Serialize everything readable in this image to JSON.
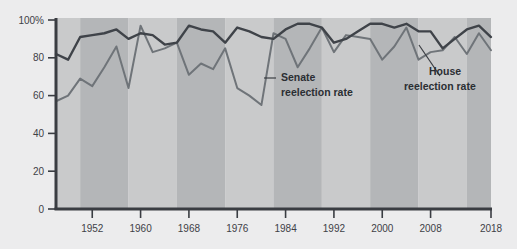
{
  "chart_data": {
    "type": "line",
    "title": "",
    "subtitle": "",
    "xlabel": "",
    "ylabel": "",
    "xlim": [
      1946,
      2018
    ],
    "ylim": [
      0,
      100
    ],
    "grid": false,
    "legend_position": "inline-annotations",
    "y_ticks": [
      0,
      20,
      40,
      60,
      80,
      100
    ],
    "y_tick_labels": [
      "0",
      "20",
      "40",
      "60",
      "80",
      "100%"
    ],
    "x_ticks": [
      1952,
      1960,
      1968,
      1976,
      1984,
      1992,
      2000,
      2008,
      2018
    ],
    "x_tick_labels": [
      "1952",
      "1960",
      "1968",
      "1976",
      "1984",
      "1992",
      "2000",
      "2008",
      "2018"
    ],
    "x": [
      1946,
      1948,
      1950,
      1952,
      1954,
      1956,
      1958,
      1960,
      1962,
      1964,
      1966,
      1968,
      1970,
      1972,
      1974,
      1976,
      1978,
      1980,
      1982,
      1984,
      1986,
      1988,
      1990,
      1992,
      1994,
      1996,
      1998,
      2000,
      2002,
      2004,
      2006,
      2008,
      2010,
      2012,
      2014,
      2016,
      2018
    ],
    "series": [
      {
        "name": "House reelection rate",
        "color": "#3f4349",
        "values": [
          82,
          79,
          91,
          92,
          93,
          95,
          90,
          93,
          92,
          87,
          88,
          97,
          95,
          94,
          88,
          96,
          94,
          91,
          90,
          95,
          98,
          98,
          96,
          88,
          90,
          94,
          98,
          98,
          96,
          98,
          94,
          94,
          85,
          90,
          95,
          97,
          91
        ]
      },
      {
        "name": "Senate reelection rate",
        "color": "#6f7479",
        "values": [
          57,
          60,
          69,
          65,
          75,
          86,
          64,
          97,
          83,
          85,
          88,
          71,
          77,
          74,
          85,
          64,
          60,
          55,
          93,
          90,
          75,
          85,
          96,
          83,
          92,
          91,
          90,
          79,
          86,
          96,
          79,
          83,
          84,
          91,
          82,
          93,
          84
        ]
      }
    ],
    "bands": [
      {
        "from": 1946,
        "to": 1950,
        "shade": "light"
      },
      {
        "from": 1950,
        "to": 1958,
        "shade": "dark"
      },
      {
        "from": 1958,
        "to": 1966,
        "shade": "light"
      },
      {
        "from": 1966,
        "to": 1974,
        "shade": "dark"
      },
      {
        "from": 1974,
        "to": 1982,
        "shade": "light"
      },
      {
        "from": 1982,
        "to": 1990,
        "shade": "dark"
      },
      {
        "from": 1990,
        "to": 1998,
        "shade": "light"
      },
      {
        "from": 1998,
        "to": 2006,
        "shade": "dark"
      },
      {
        "from": 2006,
        "to": 2014,
        "shade": "light"
      },
      {
        "from": 2014,
        "to": 2018,
        "shade": "dark"
      }
    ],
    "annotations": [
      {
        "id": "senate",
        "line1": "Senate",
        "line2": "reelection rate"
      },
      {
        "id": "house",
        "line1": "House",
        "line2": "reelection rate"
      }
    ]
  },
  "colors": {
    "page_background": "#ececed",
    "band_light": "#c9cacb",
    "band_dark": "#b4b6b8",
    "axis": "#3a3d42",
    "house_line": "#3f4349",
    "senate_line": "#6f7479",
    "tick_text": "#3e4147",
    "annotation_text": "#2b2e33"
  }
}
